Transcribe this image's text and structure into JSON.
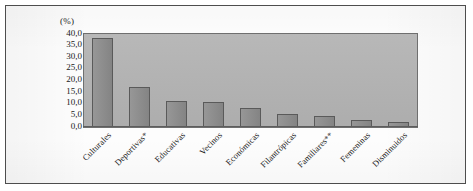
{
  "figure": {
    "unit_label": "(%)",
    "background_color": "#ffffff",
    "frame_border_color": "#4d4d4d",
    "plot_background_color": "#b4b4b4",
    "bar_fill_color": "#8b8b8b",
    "bar_border_color": "#5a5a5a",
    "axis_color": "#5d5d5d"
  },
  "chart_data": {
    "type": "bar",
    "title": "",
    "subtitle": "",
    "xlabel": "",
    "ylabel": "(%)",
    "ylim": [
      0,
      40
    ],
    "ytick_step": 5,
    "grid": false,
    "legend": false,
    "legend_position": "none",
    "tick_labels": {
      "y": [
        "40,0",
        "35,0",
        "30,0",
        "25,0",
        "20,0",
        "15,0",
        "10,0",
        "5,0",
        "0,0"
      ],
      "y_values": [
        40,
        35,
        30,
        25,
        20,
        15,
        10,
        5,
        0
      ]
    },
    "categories": [
      "Culturales",
      "Deportivas*",
      "Educativas",
      "Vecinos",
      "Económicas",
      "Filantrópicas",
      "Familiares**",
      "Femeninas",
      "Disminuidos"
    ],
    "values": [
      38.5,
      17.3,
      11.3,
      10.6,
      8.0,
      5.8,
      4.6,
      3.0,
      2.0
    ],
    "annotations": []
  }
}
